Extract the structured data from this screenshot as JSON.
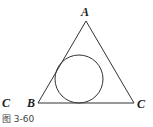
{
  "figure": {
    "caption": "图 3-60",
    "labels": {
      "apex": "A",
      "left_vertex": "B",
      "right_vertex": "C",
      "stray_left": "C"
    },
    "shapes": {
      "triangle": {
        "points": [
          [
            86,
            21
          ],
          [
            38,
            103
          ],
          [
            134,
            103
          ]
        ]
      },
      "incircle": {
        "cx": 79,
        "cy": 79,
        "r": 24
      }
    },
    "colors": {
      "stroke": "#333333",
      "text": "#222222"
    }
  }
}
